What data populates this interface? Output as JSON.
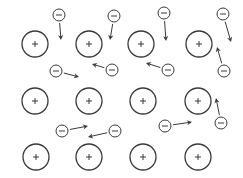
{
  "diagram": {
    "title": "",
    "stroke_color": "#3a3a3a",
    "background": "#ffffff",
    "positive_ion": {
      "symbol": "+",
      "radius": 13
    },
    "electron": {
      "symbol": "−",
      "radius": 6
    },
    "positive_ions": [
      {
        "x": 35,
        "y": 44
      },
      {
        "x": 89,
        "y": 44
      },
      {
        "x": 141,
        "y": 44
      },
      {
        "x": 199,
        "y": 44
      },
      {
        "x": 35,
        "y": 101
      },
      {
        "x": 89,
        "y": 101
      },
      {
        "x": 143,
        "y": 101
      },
      {
        "x": 198,
        "y": 101
      },
      {
        "x": 36,
        "y": 157
      },
      {
        "x": 89,
        "y": 157
      },
      {
        "x": 143,
        "y": 157
      },
      {
        "x": 198,
        "y": 157
      }
    ],
    "electrons": [
      {
        "x": 59,
        "y": 15,
        "ax": 61,
        "ay": 40
      },
      {
        "x": 114,
        "y": 16,
        "ax": 110,
        "ay": 40
      },
      {
        "x": 164,
        "y": 13,
        "ax": 166,
        "ay": 41
      },
      {
        "x": 223,
        "y": 14,
        "ax": 231,
        "ay": 42
      },
      {
        "x": 56,
        "y": 71,
        "ax": 79,
        "ay": 77
      },
      {
        "x": 112,
        "y": 70,
        "ax": 92,
        "ay": 64
      },
      {
        "x": 168,
        "y": 70,
        "ax": 146,
        "ay": 63
      },
      {
        "x": 224,
        "y": 71,
        "ax": 217,
        "ay": 47
      },
      {
        "x": 62,
        "y": 131,
        "ax": 88,
        "ay": 126
      },
      {
        "x": 115,
        "y": 131,
        "ax": 88,
        "ay": 137
      },
      {
        "x": 165,
        "y": 126,
        "ax": 192,
        "ay": 122
      },
      {
        "x": 221,
        "y": 123,
        "ax": 216,
        "ay": 98
      }
    ]
  }
}
